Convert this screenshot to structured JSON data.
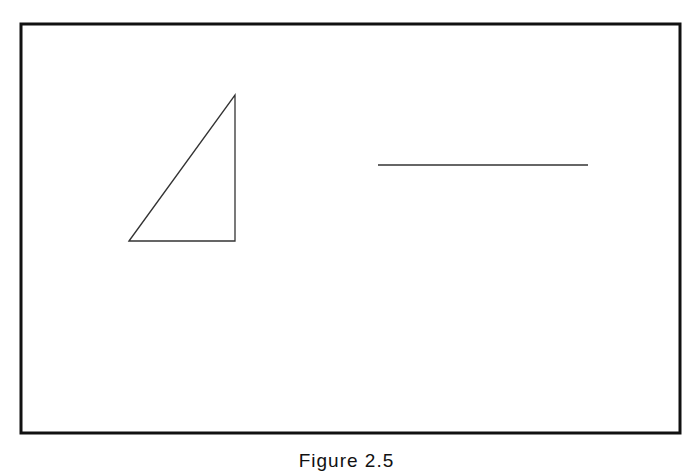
{
  "figure": {
    "caption": "Figure 2.5",
    "frame": {
      "x": 21,
      "y": 24,
      "width": 659,
      "height": 409,
      "stroke": "#111111",
      "stroke_width": 3
    },
    "shapes": [
      {
        "type": "right-triangle",
        "points": [
          [
            129,
            241
          ],
          [
            235,
            95
          ],
          [
            235,
            241
          ]
        ],
        "stroke": "#333333",
        "stroke_width": 1.3
      },
      {
        "type": "line-segment",
        "x1": 378,
        "y1": 165,
        "x2": 588,
        "y2": 165,
        "stroke": "#333333",
        "stroke_width": 1.3
      }
    ]
  }
}
